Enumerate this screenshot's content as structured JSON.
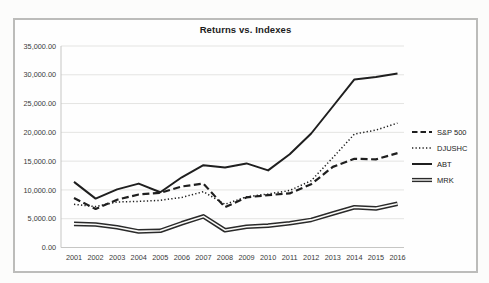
{
  "chart_data": {
    "type": "line",
    "title": "Returns vs. Indexes",
    "categories": [
      "2001",
      "2002",
      "2003",
      "2004",
      "2005",
      "2006",
      "2007",
      "2008",
      "2009",
      "2010",
      "2011",
      "2012",
      "2013",
      "2014",
      "2015",
      "2016"
    ],
    "series": [
      {
        "name": "S&P 500",
        "style": "dashed",
        "values": [
          8600,
          6700,
          8300,
          9200,
          9500,
          10600,
          11100,
          7000,
          8700,
          9100,
          9400,
          11000,
          14000,
          15400,
          15300,
          16400
        ]
      },
      {
        "name": "DJUSHC",
        "style": "dotted",
        "values": [
          7500,
          7100,
          7900,
          8000,
          8200,
          8700,
          9700,
          7500,
          8800,
          9300,
          9900,
          11600,
          15600,
          19700,
          20400,
          21600
        ]
      },
      {
        "name": "ABT",
        "style": "solid",
        "values": [
          11400,
          8500,
          10100,
          11100,
          9600,
          12200,
          14300,
          13900,
          14600,
          13400,
          16200,
          19800,
          24500,
          29200,
          29600,
          30200
        ]
      },
      {
        "name": "MRK",
        "style": "double",
        "values": [
          4100,
          4000,
          3500,
          2800,
          2900,
          4200,
          5400,
          3000,
          3600,
          3800,
          4200,
          4800,
          5900,
          7000,
          6800,
          7600
        ]
      }
    ],
    "ylim": [
      0,
      35000
    ],
    "y_tick_step": 5000,
    "y_tick_labels": [
      "0.00",
      "5,000.00",
      "10,000.00",
      "15,000.00",
      "20,000.00",
      "25,000.00",
      "30,000.00",
      "35,000.00"
    ],
    "grid": true,
    "legend_position": "right",
    "colors": {
      "line": "#1f1f1f",
      "grid": "#e4e4e2",
      "axis": "#c6c6c4",
      "tick_text": "#3a3a3a",
      "double_core": "#fafaf8"
    }
  }
}
